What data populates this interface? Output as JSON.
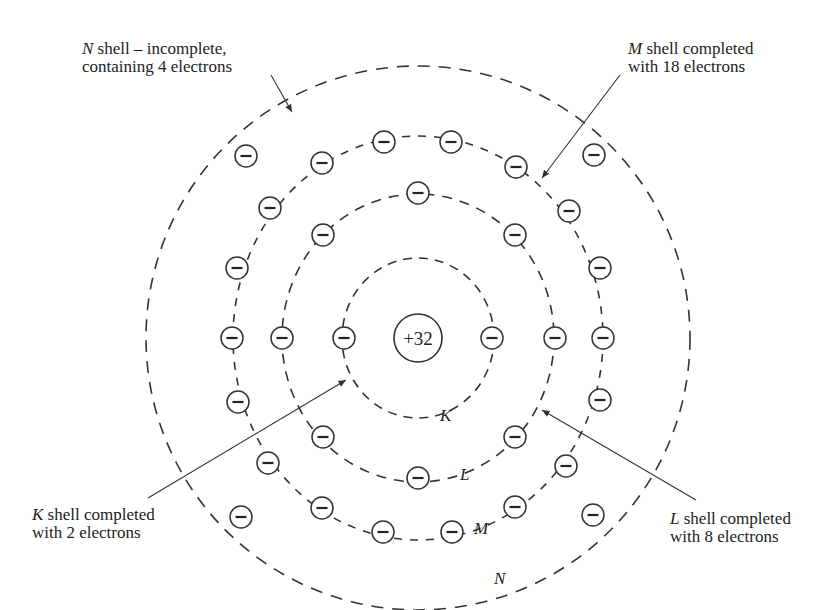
{
  "diagram": {
    "nucleus": {
      "label": "+32",
      "charge": 32
    },
    "shells": [
      {
        "name": "K",
        "electrons": 2
      },
      {
        "name": "L",
        "electrons": 8
      },
      {
        "name": "M",
        "electrons": 18
      },
      {
        "name": "N",
        "electrons": 4
      }
    ],
    "electron_symbol": "−",
    "annotations": {
      "n_shell": {
        "letter": "N",
        "line1_rest": " shell – incomplete,",
        "line2": "containing 4 electrons"
      },
      "m_shell": {
        "letter": "M",
        "line1_rest": " shell completed",
        "line2": "with 18 electrons"
      },
      "k_shell": {
        "letter": "K",
        "line1_rest": " shell completed",
        "line2": "with 2 electrons"
      },
      "l_shell": {
        "letter": "L",
        "line1_rest": " shell completed",
        "line2": "with 8 electrons"
      }
    },
    "shell_labels": {
      "k": "K",
      "l": "L",
      "m": "M",
      "n": "N"
    }
  }
}
